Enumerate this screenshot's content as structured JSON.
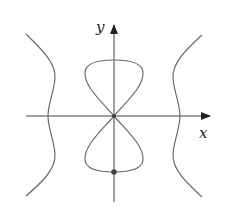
{
  "figure": {
    "type": "curve-sketch",
    "axes": {
      "x_label": "x",
      "y_label": "y"
    },
    "components": [
      {
        "name": "left-branch",
        "description": "wavy vertical curve left of origin"
      },
      {
        "name": "right-branch",
        "description": "wavy vertical curve right of origin"
      },
      {
        "name": "upper-loop",
        "description": "teardrop loop above origin"
      },
      {
        "name": "lower-loop",
        "description": "teardrop loop below origin"
      }
    ],
    "marked_point": {
      "description": "dot at bottom of lower loop on y-axis"
    },
    "colors": {
      "curve": "#6a6a6a",
      "axis": "#333333",
      "point": "#444444"
    }
  }
}
